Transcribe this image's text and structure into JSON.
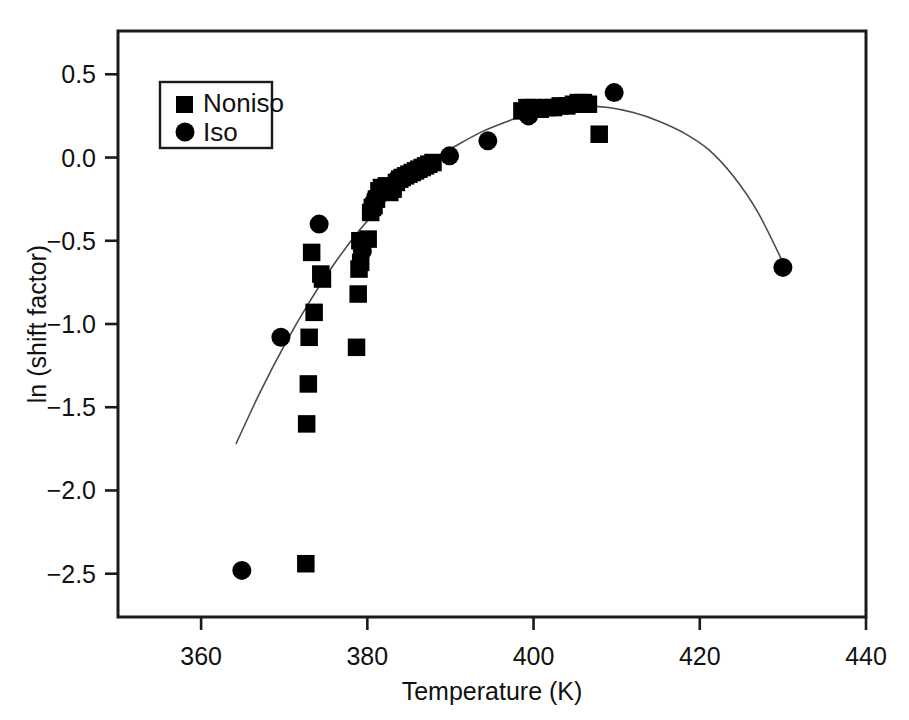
{
  "figure": {
    "background": "#ffffff",
    "foreground": "#000000"
  },
  "axes": {
    "x_title": "Temperature (K)",
    "y_title": "ln (shift factor)",
    "x_ticks": [
      "360",
      "380",
      "400",
      "420",
      "440"
    ],
    "y_ticks": [
      "0.5",
      "0.0",
      "−0.5",
      "−1.0",
      "−1.5",
      "−2.0",
      "−2.5"
    ]
  },
  "legend": {
    "items": [
      {
        "label": "Noniso",
        "marker": "square",
        "color": "#000000"
      },
      {
        "label": "Iso",
        "marker": "circle",
        "color": "#000000"
      }
    ]
  },
  "chart_data": {
    "type": "scatter",
    "title": "",
    "xlabel": "Temperature (K)",
    "ylabel": "ln (shift factor)",
    "xlim": [
      350,
      440
    ],
    "ylim": [
      -2.76,
      0.76
    ],
    "xticks": [
      360,
      380,
      400,
      420,
      440
    ],
    "yticks": [
      0.5,
      0.0,
      -0.5,
      -1.0,
      -1.5,
      -2.0,
      -2.5
    ],
    "grid": false,
    "legend_position": "upper-left",
    "series": [
      {
        "name": "Noniso",
        "marker": "square",
        "color": "#000000",
        "points": [
          [
            372.6,
            -2.44
          ],
          [
            372.7,
            -1.6
          ],
          [
            372.9,
            -1.36
          ],
          [
            373.0,
            -1.08
          ],
          [
            373.6,
            -0.93
          ],
          [
            373.3,
            -0.57
          ],
          [
            374.4,
            -0.7
          ],
          [
            374.6,
            -0.73
          ],
          [
            378.7,
            -1.14
          ],
          [
            378.9,
            -0.82
          ],
          [
            379.0,
            -0.67
          ],
          [
            379.2,
            -0.63
          ],
          [
            379.1,
            -0.5
          ],
          [
            380.1,
            -0.49
          ],
          [
            380.4,
            -0.33
          ],
          [
            380.6,
            -0.3
          ],
          [
            380.8,
            -0.29
          ],
          [
            381.1,
            -0.25
          ],
          [
            381.4,
            -0.2
          ],
          [
            381.7,
            -0.18
          ],
          [
            382.3,
            -0.17
          ],
          [
            382.7,
            -0.21
          ],
          [
            383.1,
            -0.19
          ],
          [
            383.5,
            -0.15
          ],
          [
            383.9,
            -0.13
          ],
          [
            384.2,
            -0.12
          ],
          [
            384.6,
            -0.11
          ],
          [
            385.0,
            -0.1
          ],
          [
            385.4,
            -0.09
          ],
          [
            385.8,
            -0.08
          ],
          [
            386.2,
            -0.07
          ],
          [
            386.6,
            -0.06
          ],
          [
            387.0,
            -0.05
          ],
          [
            387.4,
            -0.04
          ],
          [
            387.9,
            -0.03
          ],
          [
            398.6,
            0.28
          ],
          [
            399.2,
            0.3
          ],
          [
            400.0,
            0.3
          ],
          [
            400.8,
            0.29
          ],
          [
            401.6,
            0.3
          ],
          [
            402.4,
            0.3
          ],
          [
            403.2,
            0.31
          ],
          [
            404.0,
            0.31
          ],
          [
            404.8,
            0.32
          ],
          [
            405.4,
            0.33
          ],
          [
            406.0,
            0.33
          ],
          [
            406.6,
            0.32
          ],
          [
            407.9,
            0.14
          ]
        ]
      },
      {
        "name": "Iso",
        "marker": "circle",
        "color": "#000000",
        "points": [
          [
            364.9,
            -2.48
          ],
          [
            369.6,
            -1.08
          ],
          [
            374.2,
            -0.4
          ],
          [
            379.4,
            -0.56
          ],
          [
            381.0,
            -0.24
          ],
          [
            383.6,
            -0.13
          ],
          [
            386.0,
            -0.08
          ],
          [
            389.9,
            0.01
          ],
          [
            394.5,
            0.1
          ],
          [
            399.4,
            0.25
          ],
          [
            409.7,
            0.39
          ],
          [
            430.0,
            -0.66
          ]
        ]
      }
    ],
    "fit_curve": {
      "name": "quadratic fit",
      "color": "#4a4a4a",
      "x_range": [
        364.2,
        430.2
      ],
      "points": [
        [
          364.2,
          -1.72
        ],
        [
          367.0,
          -1.42
        ],
        [
          370.0,
          -1.13
        ],
        [
          373.0,
          -0.87
        ],
        [
          376.0,
          -0.64
        ],
        [
          379.0,
          -0.44
        ],
        [
          382.0,
          -0.27
        ],
        [
          385.0,
          -0.13
        ],
        [
          388.0,
          -0.01
        ],
        [
          391.0,
          0.08
        ],
        [
          394.0,
          0.16
        ],
        [
          397.0,
          0.22
        ],
        [
          400.0,
          0.27
        ],
        [
          403.0,
          0.3
        ],
        [
          406.0,
          0.31
        ],
        [
          409.0,
          0.3
        ],
        [
          412.0,
          0.27
        ],
        [
          415.0,
          0.22
        ],
        [
          418.0,
          0.15
        ],
        [
          421.0,
          0.05
        ],
        [
          424.0,
          -0.11
        ],
        [
          427.0,
          -0.33
        ],
        [
          430.2,
          -0.65
        ]
      ]
    }
  }
}
